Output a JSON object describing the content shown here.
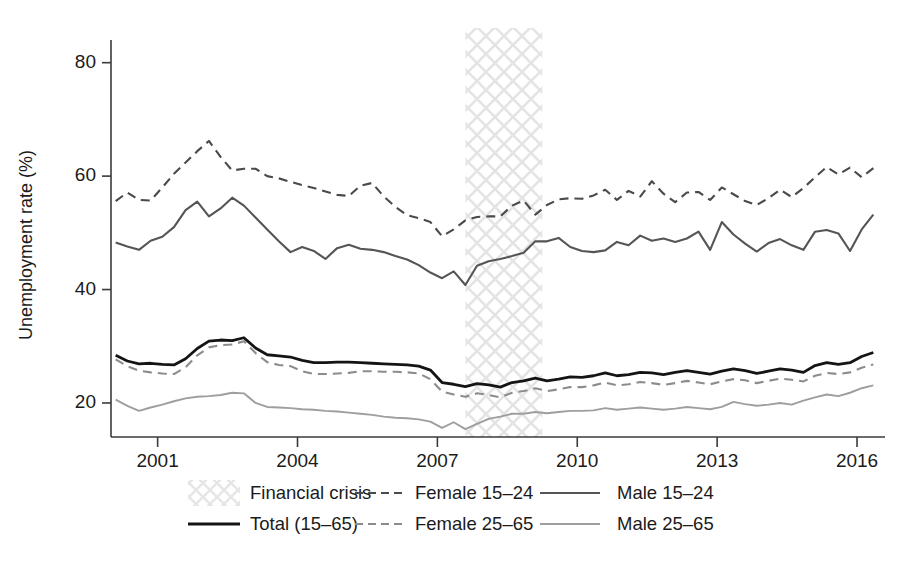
{
  "chart_data": {
    "type": "line",
    "title": "",
    "xlabel": "",
    "ylabel": "Unemployment rate (%)",
    "xlim": [
      2000.0,
      2016.6
    ],
    "ylim": [
      14,
      84
    ],
    "grid": false,
    "legend_position": "below-axes",
    "y_ticks": [
      20,
      40,
      60,
      80
    ],
    "y_tick_labels": [
      "20",
      "40",
      "60",
      "80"
    ],
    "x_ticks": [
      2001,
      2004,
      2007,
      2010,
      2013,
      2016
    ],
    "x_tick_labels": [
      "2001",
      "2004",
      "2007",
      "2010",
      "2013",
      "2016"
    ],
    "annotations": [
      {
        "name": "Financial crisis",
        "type": "vspan",
        "x_start": 2007.6,
        "x_end": 2009.25,
        "style": "crosshatch"
      }
    ],
    "x": [
      2000.1,
      2000.35,
      2000.6,
      2000.85,
      2001.1,
      2001.35,
      2001.6,
      2001.85,
      2002.1,
      2002.35,
      2002.6,
      2002.85,
      2003.1,
      2003.35,
      2003.6,
      2003.85,
      2004.1,
      2004.35,
      2004.6,
      2004.85,
      2005.1,
      2005.35,
      2005.6,
      2005.85,
      2006.1,
      2006.35,
      2006.6,
      2006.85,
      2007.1,
      2007.35,
      2007.6,
      2007.85,
      2008.1,
      2008.35,
      2008.6,
      2008.85,
      2009.1,
      2009.35,
      2009.6,
      2009.85,
      2010.1,
      2010.35,
      2010.6,
      2010.85,
      2011.1,
      2011.35,
      2011.6,
      2011.85,
      2012.1,
      2012.35,
      2012.6,
      2012.85,
      2013.1,
      2013.35,
      2013.6,
      2013.85,
      2014.1,
      2014.35,
      2014.6,
      2014.85,
      2015.1,
      2015.35,
      2015.6,
      2015.85,
      2016.1,
      2016.35
    ],
    "series": [
      {
        "name": "Female 15–24",
        "style": "dashed",
        "color": "#4a4a4a",
        "width": 2.1,
        "values": [
          55.6,
          57.1,
          55.8,
          55.7,
          58.0,
          60.4,
          62.4,
          64.4,
          66.2,
          63.4,
          61.0,
          61.3,
          61.3,
          60.0,
          59.6,
          59.0,
          58.4,
          57.9,
          57.3,
          56.7,
          56.5,
          58.3,
          58.8,
          56.4,
          54.6,
          53.1,
          52.6,
          51.9,
          49.4,
          50.6,
          52.2,
          52.8,
          52.9,
          52.9,
          54.8,
          55.7,
          53.2,
          54.9,
          55.9,
          56.1,
          56.0,
          56.6,
          57.6,
          55.8,
          57.4,
          56.4,
          59.1,
          56.9,
          55.4,
          57.1,
          57.2,
          55.8,
          58.0,
          56.8,
          55.6,
          54.9,
          56.1,
          57.6,
          56.3,
          57.9,
          59.8,
          61.6,
          60.3,
          61.5,
          59.8,
          61.4
        ]
      },
      {
        "name": "Male 15–24",
        "style": "solid",
        "color": "#555555",
        "width": 2.1,
        "values": [
          48.3,
          47.6,
          47.0,
          48.6,
          49.3,
          51.0,
          54.0,
          55.5,
          52.9,
          54.3,
          56.2,
          54.8,
          52.7,
          50.6,
          48.5,
          46.6,
          47.5,
          46.8,
          45.4,
          47.3,
          47.9,
          47.2,
          47.0,
          46.6,
          45.9,
          45.3,
          44.3,
          43.0,
          42.0,
          43.2,
          40.8,
          44.2,
          45.0,
          45.4,
          45.9,
          46.5,
          48.5,
          48.5,
          49.1,
          47.5,
          46.8,
          46.6,
          46.9,
          48.4,
          47.8,
          49.5,
          48.6,
          49.0,
          48.4,
          49.0,
          50.2,
          47.0,
          51.9,
          49.7,
          48.1,
          46.7,
          48.2,
          48.9,
          47.8,
          47.0,
          50.2,
          50.5,
          49.9,
          46.8,
          50.6,
          53.2
        ]
      },
      {
        "name": "Total (15–65)",
        "style": "solid",
        "color": "#141414",
        "width": 2.8,
        "values": [
          28.4,
          27.4,
          26.9,
          27.0,
          26.8,
          26.7,
          27.8,
          29.6,
          30.9,
          31.1,
          31.0,
          31.5,
          29.7,
          28.5,
          28.3,
          28.1,
          27.5,
          27.1,
          27.1,
          27.2,
          27.2,
          27.1,
          27.0,
          26.9,
          26.8,
          26.7,
          26.5,
          25.8,
          23.6,
          23.3,
          22.9,
          23.4,
          23.2,
          22.8,
          23.6,
          23.9,
          24.4,
          23.9,
          24.2,
          24.6,
          24.5,
          24.8,
          25.3,
          24.8,
          25.0,
          25.4,
          25.3,
          25.0,
          25.4,
          25.7,
          25.4,
          25.1,
          25.6,
          26.0,
          25.7,
          25.2,
          25.6,
          26.0,
          25.8,
          25.4,
          26.6,
          27.1,
          26.8,
          27.1,
          28.2,
          28.9
        ]
      },
      {
        "name": "Female 25–65",
        "style": "dashed",
        "color": "#8c8c8c",
        "width": 2.1,
        "values": [
          27.7,
          26.5,
          25.7,
          25.4,
          25.2,
          25.1,
          26.3,
          28.4,
          29.8,
          30.2,
          30.3,
          30.9,
          28.8,
          27.2,
          26.7,
          26.5,
          25.6,
          25.1,
          25.1,
          25.2,
          25.3,
          25.6,
          25.6,
          25.5,
          25.5,
          25.4,
          25.2,
          24.2,
          22.0,
          21.5,
          21.1,
          21.7,
          21.4,
          21.0,
          21.8,
          22.1,
          22.6,
          22.1,
          22.4,
          22.8,
          22.8,
          23.1,
          23.6,
          23.1,
          23.3,
          23.7,
          23.5,
          23.2,
          23.5,
          23.9,
          23.6,
          23.3,
          23.8,
          24.2,
          24.0,
          23.5,
          23.9,
          24.3,
          24.1,
          23.8,
          24.8,
          25.3,
          25.1,
          25.4,
          26.2,
          26.8
        ]
      },
      {
        "name": "Male 25–65",
        "style": "solid",
        "color": "#9e9e9e",
        "width": 1.9,
        "values": [
          20.6,
          19.5,
          18.6,
          19.2,
          19.7,
          20.3,
          20.8,
          21.1,
          21.2,
          21.4,
          21.8,
          21.7,
          20.0,
          19.3,
          19.2,
          19.1,
          18.9,
          18.8,
          18.6,
          18.5,
          18.3,
          18.1,
          17.9,
          17.6,
          17.4,
          17.3,
          17.1,
          16.7,
          15.6,
          16.6,
          15.4,
          16.3,
          17.2,
          17.6,
          18.1,
          18.1,
          18.4,
          18.2,
          18.4,
          18.6,
          18.6,
          18.7,
          19.1,
          18.8,
          19.0,
          19.2,
          19.0,
          18.8,
          19.0,
          19.3,
          19.1,
          18.9,
          19.3,
          20.2,
          19.8,
          19.5,
          19.7,
          20.0,
          19.7,
          20.4,
          21.0,
          21.5,
          21.2,
          21.8,
          22.6,
          23.1
        ]
      }
    ]
  },
  "legend": {
    "rows": [
      [
        {
          "label": "Financial crisis",
          "marker": "crosshatch-swatch"
        },
        {
          "label": "Female 15–24",
          "marker": "dashed-line-dark"
        },
        {
          "label": "Male 15–24",
          "marker": "solid-line-mid"
        }
      ],
      [
        {
          "label": "Total (15–65)",
          "marker": "solid-line-black"
        },
        {
          "label": "Female 25–65",
          "marker": "dashed-line-gray"
        },
        {
          "label": "Male 25–65",
          "marker": "solid-line-light"
        }
      ]
    ]
  },
  "colors": {
    "axis": "#3a3a3a",
    "text": "#1b1b1b",
    "total": "#141414",
    "female_15_24": "#4a4a4a",
    "male_15_24": "#555555",
    "female_25_65": "#8c8c8c",
    "male_25_65": "#9e9e9e",
    "crisis_band": "#ececec",
    "background": "#ffffff"
  }
}
